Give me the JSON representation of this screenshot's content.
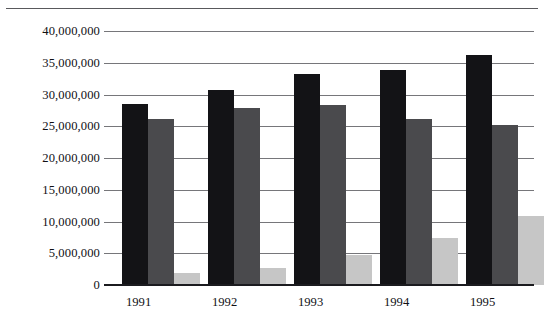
{
  "chart_data": {
    "type": "bar",
    "title": "",
    "subtitle": "",
    "xlabel": "",
    "ylabel": "",
    "categories": [
      "1991",
      "1992",
      "1993",
      "1994",
      "1995"
    ],
    "ylim": [
      0,
      40000000
    ],
    "ytick_step": 5000000,
    "ytick_labels": [
      "40,000,000",
      "35,000,000",
      "30,000,000",
      "25,000,000",
      "20,000,000",
      "15,000,000",
      "10,000,000",
      "5,000,000",
      "0"
    ],
    "ytick_values": [
      40000000,
      35000000,
      30000000,
      25000000,
      20000000,
      15000000,
      10000000,
      5000000,
      0
    ],
    "grid": true,
    "legend": "none",
    "series": [
      {
        "name": "series-1",
        "color": "#131316",
        "values": [
          28500000,
          30700000,
          33200000,
          33800000,
          36200000
        ]
      },
      {
        "name": "series-2",
        "color": "#4a4a4d",
        "values": [
          26200000,
          27900000,
          28300000,
          26100000,
          25200000
        ]
      },
      {
        "name": "series-3",
        "color": "#c6c6c6",
        "values": [
          1900000,
          2700000,
          4700000,
          7400000,
          10900000
        ]
      }
    ]
  },
  "axis": {
    "baseline_color": "#1b1b1f",
    "gridline_color": "#76767a"
  }
}
